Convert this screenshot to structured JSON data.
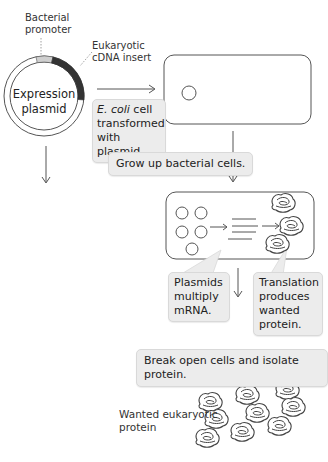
{
  "labels": {
    "bacterial_promoter": [
      "Bacterial",
      "promoter"
    ],
    "eukaryotic_insert": [
      "Eukaryotic",
      "cDNA insert"
    ],
    "plasmid": [
      "Expression",
      "plasmid"
    ],
    "wanted_protein": [
      "Wanted eukaryotic",
      "protein"
    ]
  },
  "callouts": {
    "transformed": {
      "italic": "E. coli",
      "rest1": " cell",
      "line2": "transformed",
      "line3": "with plasmid."
    },
    "grow": "Grow up bacterial cells.",
    "plasmids_multiply": [
      "Plasmids",
      "multiply",
      "mRNA."
    ],
    "translation": [
      "Translation",
      "produces",
      "wanted",
      "protein."
    ],
    "break_open": "Break open cells and isolate protein."
  },
  "colors": {
    "line": "#555555",
    "promoter_segment": "#cfcfcf",
    "insert_segment": "#333333",
    "callout_bg": "#ececec"
  }
}
